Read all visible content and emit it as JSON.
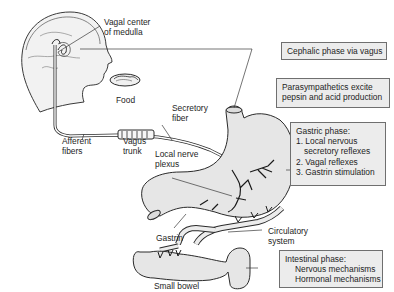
{
  "labels": {
    "vagal_center": [
      "Vagal center",
      "of medulla"
    ],
    "food": "Food",
    "secretory_fiber": [
      "Secretory",
      "fiber"
    ],
    "afferent_fibers": [
      "Afferent",
      "fibers"
    ],
    "vagus_trunk": [
      "Vagus",
      "trunk"
    ],
    "local_nerve_plexus": [
      "Local nerve",
      "plexus"
    ],
    "gastrin": "Gastrin",
    "circulatory_system": [
      "Circulatory",
      "system"
    ],
    "small_bowel": "Small bowel"
  },
  "boxes": {
    "cephalic": "Cephalic phase via vagus",
    "parasympathetics": [
      "Parasympathetics excite",
      "pepsin and acid production"
    ],
    "gastric": {
      "title": "Gastric phase:",
      "items": [
        "1. Local nervous",
        "secretory reflexes",
        "2. Vagal reflexes",
        "3. Gastrin stimulation"
      ]
    },
    "intestinal": {
      "title": "Intestinal phase:",
      "items": [
        "Nervous mechanisms",
        "Hormonal mechanisms"
      ]
    }
  },
  "colors": {
    "box_fill": "#ececec",
    "organ_fill": "#e6e6e6",
    "head_fill": "#f2f2f2",
    "line": "#2a2a2a"
  }
}
